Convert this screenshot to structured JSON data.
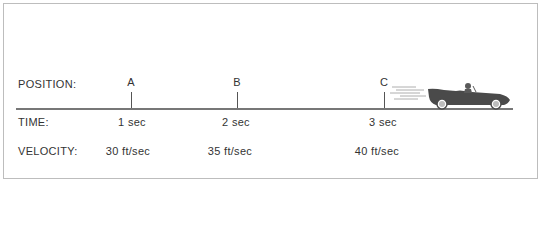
{
  "diagram": {
    "row_labels": {
      "position": "POSITION:",
      "time": "TIME:",
      "velocity": "VELOCITY:"
    },
    "markers": [
      {
        "position": "A",
        "time": "1 sec",
        "velocity": "30 ft/sec"
      },
      {
        "position": "B",
        "time": "2 sec",
        "velocity": "35 ft/sec"
      },
      {
        "position": "C",
        "time": "3 sec",
        "velocity": "40 ft/sec"
      }
    ],
    "object": "car-icon",
    "colors": {
      "text": "#333333",
      "axis": "#777777",
      "car": "#4a4a4a",
      "border": "#bdbdbd"
    }
  }
}
